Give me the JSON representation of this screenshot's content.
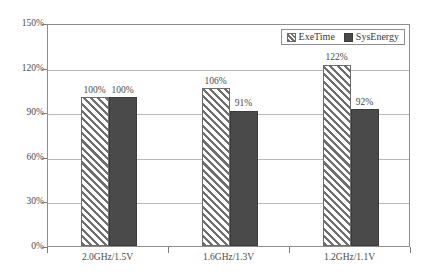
{
  "chart_data": {
    "type": "bar",
    "title": "",
    "subtitle": "",
    "xlabel": "",
    "ylabel": "",
    "categories": [
      "2.0GHz/1.5V",
      "1.6GHz/1.3V",
      "1.2GHz/1.1V"
    ],
    "series": [
      {
        "name": "ExeTime",
        "values": [
          100,
          106,
          122
        ],
        "labels": [
          "100%",
          "106%",
          "122%"
        ],
        "fill": "diagonal-hatch",
        "color": "#6e6e6e"
      },
      {
        "name": "SysEnergy",
        "values": [
          100,
          91,
          92
        ],
        "labels": [
          "100%",
          "91%",
          "92%"
        ],
        "fill": "solid",
        "color": "#4a4a4a"
      }
    ],
    "ylim": [
      0,
      150
    ],
    "ytick_values": [
      0,
      30,
      60,
      90,
      120,
      150
    ],
    "ytick_labels": [
      "0%",
      "30%",
      "60%",
      "90%",
      "120%",
      "150%"
    ],
    "grid": true,
    "grid_axis": "y",
    "legend_position": "top-right",
    "unit": "%"
  },
  "legend": {
    "items": [
      {
        "label": "ExeTime"
      },
      {
        "label": "SysEnergy"
      }
    ]
  }
}
